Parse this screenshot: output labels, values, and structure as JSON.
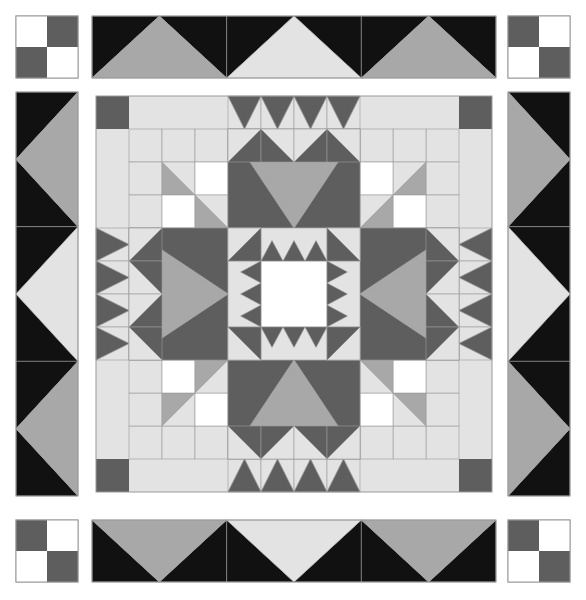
{
  "artwork": {
    "title": "Feathered Star Medallion Quilt",
    "type": "quilt-pattern-image",
    "canvas": {
      "width": 586,
      "height": 600,
      "background": "#ffffff"
    }
  },
  "palette": {
    "white": "#ffffff",
    "light": "#e3e3e3",
    "medium": "#a8a8a8",
    "dark": "#5e5e5e",
    "black": "#111111",
    "seam": "#9a9a9a"
  },
  "layout": {
    "outer_margin_left": 16,
    "outer_margin_top": 16,
    "outer_size": 554,
    "corner_block": 62,
    "gap": 4,
    "border_strip": 62,
    "inner_origin_x": 96,
    "inner_origin_y": 96,
    "inner_size": 396,
    "grid_cells": 12,
    "cell": 33
  },
  "blocks": {
    "corner_four_patch": {
      "name": "four-patch",
      "count": 4,
      "colors": [
        "white",
        "dark",
        "dark",
        "white"
      ],
      "positions": [
        "top-left",
        "top-right",
        "bottom-left",
        "bottom-right"
      ]
    },
    "border_sawtooth": {
      "name": "flying-geese-border",
      "geese_per_side": 3,
      "background": "black",
      "triangle_colors": [
        "medium",
        "light"
      ]
    },
    "side_hourglass": {
      "name": "side-star-point",
      "count": 4,
      "background": "black",
      "triangle_colors": [
        "medium",
        "light"
      ]
    },
    "center_medallion": {
      "name": "feathered-star-center",
      "center_square_color": "white",
      "ring_colors": [
        "light",
        "dark",
        "medium"
      ]
    }
  },
  "legend": {
    "swatches": [
      {
        "label": "White",
        "color": "#ffffff"
      },
      {
        "label": "Light Gray",
        "color": "#e3e3e3"
      },
      {
        "label": "Medium Gray",
        "color": "#a8a8a8"
      },
      {
        "label": "Dark Gray",
        "color": "#5e5e5e"
      },
      {
        "label": "Black",
        "color": "#111111"
      }
    ]
  }
}
